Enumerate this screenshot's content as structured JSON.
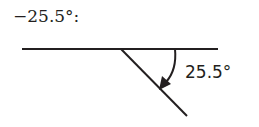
{
  "title": "−25.5°:",
  "angle_label": "25.5°",
  "colors": {
    "stroke": "#231f20"
  }
}
